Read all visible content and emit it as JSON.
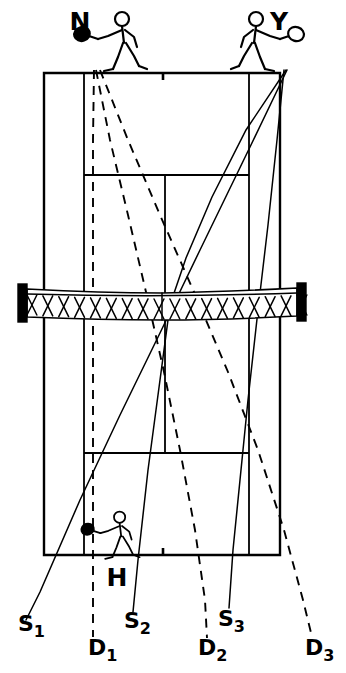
{
  "figure": {
    "kind": "tennis-court-trajectory-diagram",
    "background_color": "#ffffff",
    "ink_color": "#000000",
    "width": 346,
    "height": 673
  },
  "players": [
    {
      "id": "N",
      "label": "N",
      "label_x": 80,
      "label_y": 30,
      "position_side": "far-court-left",
      "figure_x": 120,
      "figure_y": 45,
      "facing": "left",
      "racket_x": 98,
      "racket_y": 48
    },
    {
      "id": "Y",
      "label": "Y",
      "label_x": 279,
      "label_y": 30,
      "position_side": "far-court-right",
      "figure_x": 258,
      "figure_y": 45,
      "facing": "right",
      "racket_x": 285,
      "racket_y": 52
    },
    {
      "id": "H",
      "label": "H",
      "label_x": 117,
      "label_y": 586,
      "position_side": "near-court-baseline",
      "figure_x": 118,
      "figure_y": 538,
      "facing": "left",
      "racket_x": 92,
      "racket_y": 546
    }
  ],
  "court": {
    "baseline_top_y": 73,
    "baseline_bottom_y": 555,
    "doubles_left_x": 44,
    "doubles_right_x": 280,
    "singles_left_x": 84,
    "singles_right_x": 249,
    "service_line_top_y": 175,
    "service_line_bottom_y": 453,
    "center_line_x": 165,
    "net_y": 300,
    "net_left_x": 27,
    "net_right_x": 297,
    "center_mark_top_x": 163,
    "center_mark_bottom_x": 163
  },
  "net": {
    "top_y": 286,
    "bottom_y": 316,
    "band_thickness": 5,
    "post_width": 9,
    "mesh_cells": 17
  },
  "trajectory_labels": [
    {
      "id": "S1",
      "base": "S",
      "sub": "1",
      "x": 18,
      "y": 631,
      "style": "solid"
    },
    {
      "id": "D1",
      "base": "D",
      "sub": "1",
      "x": 88,
      "y": 655,
      "style": "dashed"
    },
    {
      "id": "S2",
      "base": "S",
      "sub": "2",
      "x": 124,
      "y": 628,
      "style": "solid"
    },
    {
      "id": "D2",
      "base": "D",
      "sub": "2",
      "x": 198,
      "y": 655,
      "style": "dashed"
    },
    {
      "id": "S3",
      "base": "S",
      "sub": "3",
      "x": 218,
      "y": 626,
      "style": "solid"
    },
    {
      "id": "D3",
      "base": "D",
      "sub": "3",
      "x": 305,
      "y": 655,
      "style": "dashed"
    }
  ],
  "trajectories": {
    "solid": [
      {
        "id": "S1",
        "from": "Y",
        "description": "long cross-court from Y to lower-left",
        "points": "287,70 250,147 200,250 160,333 120,415 80,500 40,592 26,620"
      },
      {
        "id": "S2",
        "from": "Y",
        "description": "from Y through net centre down to S2 label",
        "points": "286,70 246,130 212,197 186,258 170,305 160,380 148,470 138,560 133,612"
      },
      {
        "id": "S3",
        "from": "Y",
        "description": "steep line from Y near right sideline to S3",
        "points": "284,70 277,140 268,225 258,310 248,400 240,480 233,550 229,608"
      }
    ],
    "dashed": [
      {
        "id": "D1",
        "from": "N",
        "description": "near-vertical dashed from N down left side",
        "points": "94,70 93,140 93,215 93,290 93,370 93,450 93,530 93,600 93,637"
      },
      {
        "id": "D2",
        "from": "N",
        "description": "dashed from N angling right through centre",
        "points": "96,70 110,140 128,215 146,292 164,372 180,450 195,530 205,600 207,638"
      },
      {
        "id": "D3",
        "from": "N",
        "description": "widest dashed from N to lower right corner",
        "points": "100,70 128,140 160,215 194,292 228,372 258,450 284,530 303,600 312,637"
      }
    ]
  }
}
